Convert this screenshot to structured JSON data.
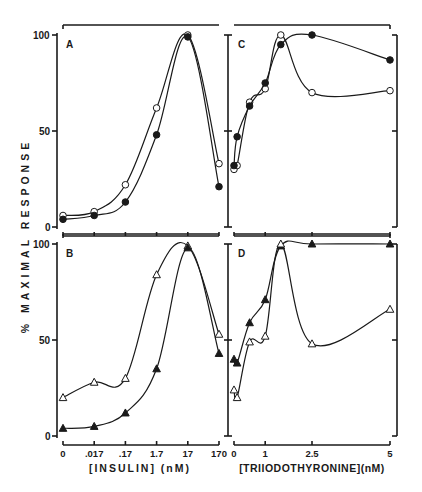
{
  "figure": {
    "y_axis_label": "% MAXIMAL RESPONSE",
    "y_label_parts": [
      "%",
      "MAXIMAL",
      "RESPONSE"
    ],
    "left_xlabel": "[INSULIN] (nM)",
    "left_xlabel_main": "INSULIN",
    "left_xlabel_unit": "(nM)",
    "right_xlabel": "[TRIIODOTHYRONINE] (nM)",
    "right_xlabel_main": "TRIIODOTHYRONINE",
    "right_xlabel_unit": "(nM)",
    "y_ticks": [
      "0",
      "50",
      "100"
    ],
    "insulin_ticks": [
      "0",
      ".017",
      ".17",
      "1.7",
      "17",
      "170"
    ],
    "t3_ticks": [
      "0",
      "1",
      "2.5",
      "5"
    ]
  },
  "chart_data": [
    {
      "panel": "A",
      "type": "line",
      "title": "",
      "xlabel": "[INSULIN] (nM)",
      "ylabel": "% MAXIMAL RESPONSE",
      "categories": [
        "0",
        ".017",
        ".17",
        "1.7",
        "17",
        "170"
      ],
      "ylim": [
        0,
        100
      ],
      "grid": false,
      "series": [
        {
          "name": "open circles",
          "marker": "open-circle",
          "values": [
            6,
            8,
            22,
            62,
            100,
            33
          ]
        },
        {
          "name": "filled circles",
          "marker": "filled-circle",
          "values": [
            4,
            6,
            13,
            48,
            99,
            21
          ]
        }
      ]
    },
    {
      "panel": "B",
      "type": "line",
      "title": "",
      "xlabel": "[INSULIN] (nM)",
      "ylabel": "% MAXIMAL RESPONSE",
      "categories": [
        "0",
        ".017",
        ".17",
        "1.7",
        "17",
        "170"
      ],
      "ylim": [
        0,
        100
      ],
      "grid": false,
      "series": [
        {
          "name": "open triangles",
          "marker": "open-triangle",
          "values": [
            20,
            28,
            30,
            84,
            99,
            53
          ]
        },
        {
          "name": "filled triangles",
          "marker": "filled-triangle",
          "values": [
            4,
            5,
            12,
            35,
            98,
            43
          ]
        }
      ]
    },
    {
      "panel": "C",
      "type": "line",
      "title": "",
      "xlabel": "[TRIIODOTHYRONINE] (nM)",
      "ylabel": "% MAXIMAL RESPONSE",
      "x": [
        0,
        0.1,
        0.5,
        1,
        1.5,
        2.5,
        5
      ],
      "xlim": [
        0,
        5
      ],
      "ylim": [
        0,
        100
      ],
      "grid": false,
      "series": [
        {
          "name": "open circles",
          "marker": "open-circle",
          "values": [
            30,
            32,
            65,
            72,
            100,
            70,
            71
          ]
        },
        {
          "name": "filled circles",
          "marker": "filled-circle",
          "values": [
            32,
            47,
            63,
            75,
            95,
            100,
            87
          ]
        }
      ]
    },
    {
      "panel": "D",
      "type": "line",
      "title": "",
      "xlabel": "[TRIIODOTHYRONINE] (nM)",
      "ylabel": "% MAXIMAL RESPONSE",
      "x": [
        0,
        0.1,
        0.5,
        1,
        1.5,
        2.5,
        5
      ],
      "xlim": [
        0,
        5
      ],
      "ylim": [
        0,
        100
      ],
      "grid": false,
      "series": [
        {
          "name": "filled triangles",
          "marker": "filled-triangle",
          "values": [
            40,
            38,
            59,
            71,
            99,
            100,
            100
          ]
        },
        {
          "name": "open triangles",
          "marker": "open-triangle",
          "values": [
            24,
            20,
            49,
            52,
            100,
            48,
            66
          ]
        }
      ]
    }
  ],
  "colors": {
    "ink": "#1a1a1a",
    "background": "#ffffff"
  }
}
